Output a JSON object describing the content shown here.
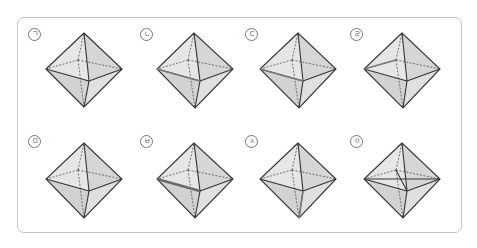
{
  "figure": {
    "title": "",
    "colors": {
      "frame_border": "#c4c4c4",
      "face_light": "#e8e8e8",
      "face_dark": "#cfcfcf",
      "edge": "#333333",
      "hidden_edge": "#555555",
      "highlight": "#7a7a7a"
    },
    "items": [
      {
        "label": "ㄱ"
      },
      {
        "label": "ㄴ"
      },
      {
        "label": "ㄷ"
      },
      {
        "label": "ㄹ"
      },
      {
        "label": "ㅁ"
      },
      {
        "label": "ㅂ"
      },
      {
        "label": "ㅅ"
      },
      {
        "label": "ㅇ"
      }
    ]
  }
}
